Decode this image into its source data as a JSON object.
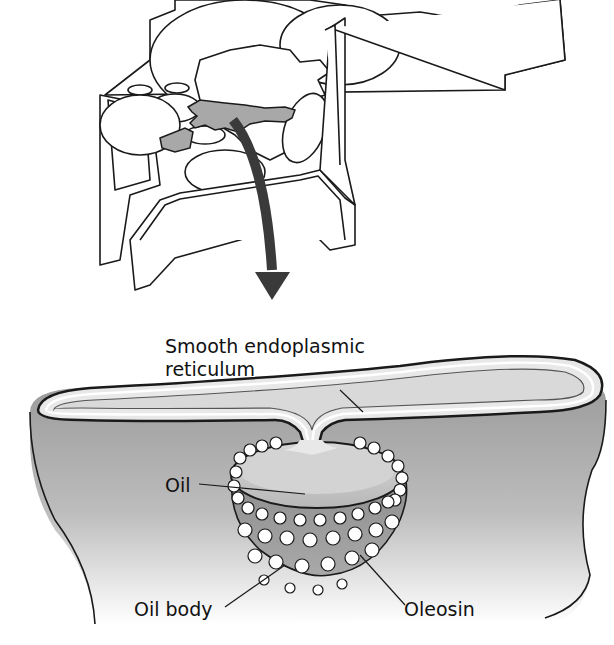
{
  "diagram": {
    "type": "biological-illustration",
    "panels": [
      {
        "id": "cell",
        "description": "3D plant cell cutaway with highlighted smooth ER region"
      },
      {
        "id": "detail",
        "description": "Enlarged view of oil body budding from smooth ER"
      }
    ],
    "arrow": {
      "from": "cell",
      "to": "detail",
      "meaning": "enlarged view"
    },
    "labels": {
      "ser": "Smooth endoplasmic reticulum",
      "ser_line1": "Smooth endoplasmic",
      "ser_line2": "reticulum",
      "oil": "Oil",
      "oil_body": "Oil body",
      "oleosin": "Oleosin"
    },
    "colors": {
      "outline": "#1a1a1a",
      "highlight_region": "#a8a8a8",
      "arrow": "#3a3a3a",
      "cytoplasm_top": "#9a9a9a",
      "cytoplasm_bottom": "#ffffff",
      "oil": "#c8c8c8",
      "oleosin": "#ffffff"
    }
  }
}
